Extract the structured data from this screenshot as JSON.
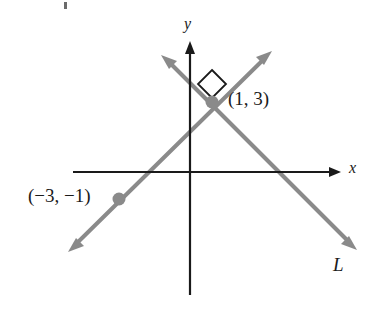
{
  "figure": {
    "type": "coordinate-geometry-diagram",
    "colors": {
      "axis": "#1a1a1a",
      "line": "#8a8a8a",
      "point": "#8a8a8a",
      "label": "#1a1a1a",
      "background": "#ffffff"
    }
  },
  "axes": {
    "x_label": "x",
    "y_label": "y",
    "origin": {
      "x": 190,
      "y": 172
    },
    "x_axis": {
      "x1": 73,
      "y1": 172,
      "x2": 340,
      "y2": 172,
      "arrow": "right"
    },
    "y_axis": {
      "x1": 190,
      "y1": 42,
      "x2": 190,
      "y2": 295,
      "arrow": "up"
    }
  },
  "lines": [
    {
      "name": "L",
      "label": "L",
      "label_position": {
        "x": 333,
        "y": 255
      },
      "arrows": "both",
      "from": {
        "x": 163,
        "y": 57
      },
      "to": {
        "x": 355,
        "y": 248
      }
    },
    {
      "name": "perpendicular-line",
      "label": "",
      "arrows": "both",
      "from": {
        "x": 270,
        "y": 53
      },
      "to": {
        "x": 70,
        "y": 250
      }
    }
  ],
  "points": [
    {
      "name": "intersection-point",
      "label": "(1, 3)",
      "coordinates": {
        "x": 1,
        "y": 3
      },
      "pixel": {
        "x": 212,
        "y": 102
      }
    },
    {
      "name": "second-point",
      "label": "(−3, −1)",
      "coordinates": {
        "x": -3,
        "y": -1
      },
      "pixel": {
        "x": 119,
        "y": 199
      }
    }
  ],
  "markers": [
    {
      "name": "right-angle-marker",
      "shape": "square",
      "at": {
        "x": 212,
        "y": 84
      }
    }
  ]
}
